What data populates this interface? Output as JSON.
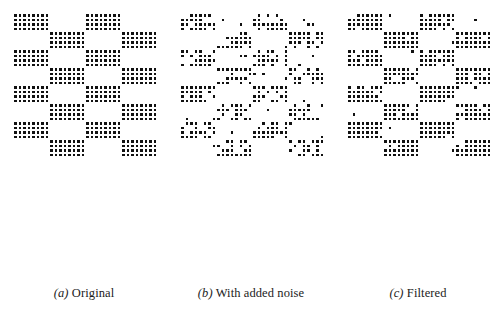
{
  "figure": {
    "background_color": "#ffffff",
    "dot_color": "#111111",
    "width": 504,
    "height": 316
  },
  "panels": [
    {
      "id": "original",
      "caption_tag": "(a)",
      "caption_text": "Original",
      "caption": "(a) Original"
    },
    {
      "id": "with-added-noise",
      "caption_tag": "(b)",
      "caption_text": "With added noise",
      "caption": "(b) With added noise"
    },
    {
      "id": "filtered",
      "caption_tag": "(c)",
      "caption_text": "Filtered",
      "caption": "(c) Filtered"
    }
  ],
  "chart_data": {
    "type": "heatmap",
    "xlabel": "",
    "ylabel": "",
    "subplots": [
      "(a) Original",
      "(b) With added noise",
      "(c) Filtered"
    ],
    "grid": {
      "block_cols": 4,
      "block_rows": 8,
      "dots_per_block_x": 8,
      "dots_per_block_y": 4,
      "dot_pitch_px": 4.5,
      "dot_size_px": 2.6,
      "origin_x_px": 14,
      "origin_y_px": 14,
      "pattern": "checkerboard: block (r,c) is filled when (r + c) is even"
    },
    "series": [
      {
        "name": "(a) Original",
        "description": "Clean checkerboard of 8x4 dot blocks, no noise",
        "noise_added_fraction": 0.0,
        "noise_removed_fraction": 0.0,
        "seed": 11
      },
      {
        "name": "(b) With added noise",
        "description": "Same checkerboard corrupted by salt-and-pepper noise",
        "noise_added_fraction": 0.06,
        "noise_removed_fraction": 0.38,
        "seed": 7
      },
      {
        "name": "(c) Filtered",
        "description": "Median-filtered result, pattern largely restored with residual speckle",
        "noise_added_fraction": 0.012,
        "noise_removed_fraction": 0.1,
        "seed": 23
      }
    ]
  }
}
